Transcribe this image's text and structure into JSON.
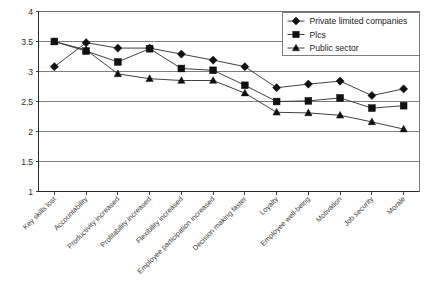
{
  "chart_data": {
    "type": "line",
    "title": "",
    "subtitle": "",
    "xlabel": "",
    "ylabel": "",
    "ylim": [
      1,
      4
    ],
    "ytick_values": [
      1,
      1.5,
      2,
      2.5,
      3,
      3.5,
      4
    ],
    "ytick_labels": [
      "1",
      "1.5",
      "2",
      "2.5",
      "3",
      "3.5",
      "4"
    ],
    "grid": true,
    "grid_axis": "y",
    "legend_position": "top-right",
    "categories": [
      "Key skills lost",
      "Accountability",
      "Productivity increased",
      "Profitability increased",
      "Flexibility increased",
      "Employee participation increased",
      "Decision making faster",
      "Loyalty",
      "Employee well-being",
      "Motivation",
      "Job security",
      "Morale"
    ],
    "series": [
      {
        "name": "Private limited companies",
        "marker": "diamond",
        "color": "#111111",
        "values": [
          3.08,
          3.48,
          3.39,
          3.39,
          3.29,
          3.19,
          3.08,
          2.73,
          2.79,
          2.84,
          2.6,
          2.71
        ]
      },
      {
        "name": "Plcs",
        "marker": "square",
        "color": "#111111",
        "values": [
          3.5,
          3.34,
          3.16,
          3.38,
          3.05,
          3.02,
          2.77,
          2.5,
          2.51,
          2.56,
          2.39,
          2.43
        ]
      },
      {
        "name": "Public sector",
        "marker": "triangle",
        "color": "#111111",
        "values": [
          3.5,
          3.36,
          2.96,
          2.88,
          2.85,
          2.85,
          2.64,
          2.32,
          2.31,
          2.27,
          2.16,
          2.04
        ]
      }
    ]
  },
  "legend": {
    "entries": [
      {
        "label": "Private limited companies",
        "marker": "diamond"
      },
      {
        "label": "Plcs",
        "marker": "square"
      },
      {
        "label": "Public sector",
        "marker": "triangle"
      }
    ]
  },
  "axes": {
    "y_max_label": "4",
    "y_min_label": "1"
  }
}
